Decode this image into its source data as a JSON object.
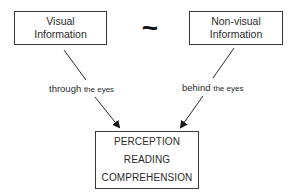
{
  "diagram": {
    "top_left_box": {
      "lines": [
        "Visual",
        "Information"
      ]
    },
    "top_right_box": {
      "lines": [
        "Non-visual",
        "Information"
      ]
    },
    "connector_symbol": "~",
    "left_edge_label": {
      "main": "through",
      "small": "the eyes"
    },
    "right_edge_label": {
      "main": "behind",
      "small": "the eyes"
    },
    "bottom_box": {
      "lines": [
        "PERCEPTION",
        "READING",
        "COMPREHENSION"
      ]
    }
  },
  "colors": {
    "line": "#2a2a2a",
    "background": "#ffffff"
  }
}
